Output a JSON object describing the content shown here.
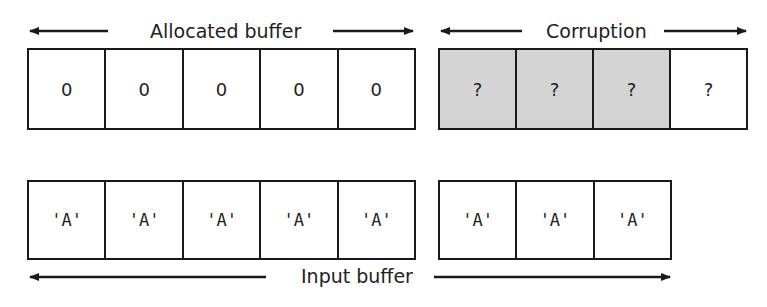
{
  "diagram": {
    "top_row": {
      "allocated": {
        "label": "Allocated buffer",
        "cells": [
          "0",
          "0",
          "0",
          "0",
          "0"
        ]
      },
      "corruption": {
        "label": "Corruption",
        "cells": [
          "?",
          "?",
          "?",
          "?"
        ],
        "shaded_cells": [
          0,
          1,
          2
        ],
        "shade_color": "#d4d4d4"
      }
    },
    "bottom_row": {
      "label": "Input buffer",
      "group1_cells": [
        "'A'",
        "'A'",
        "'A'",
        "'A'",
        "'A'"
      ],
      "group2_cells": [
        "'A'",
        "'A'",
        "'A'"
      ]
    }
  }
}
